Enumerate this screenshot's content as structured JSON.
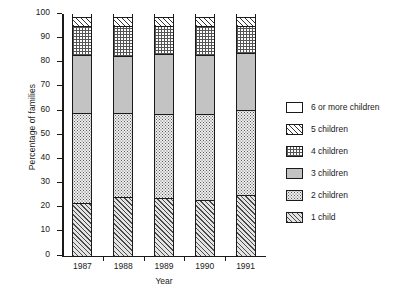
{
  "chart_data": {
    "type": "bar",
    "stacked": true,
    "title": "",
    "xlabel": "Year",
    "ylabel": "Percentage of families",
    "categories": [
      "1987",
      "1988",
      "1989",
      "1990",
      "1991"
    ],
    "ylim": [
      0,
      100
    ],
    "yticks": [
      0,
      10,
      20,
      30,
      40,
      50,
      60,
      70,
      80,
      90,
      100
    ],
    "grid": false,
    "legend_position": "right",
    "series": [
      {
        "name": "1 child",
        "pattern": "diagonal-hatch",
        "values": [
          21.5,
          24.0,
          23.5,
          22.5,
          24.5
        ]
      },
      {
        "name": "2 children",
        "pattern": "fine-stipple",
        "values": [
          37.0,
          34.5,
          34.5,
          35.5,
          35.5
        ]
      },
      {
        "name": "3 children",
        "pattern": "solid-grey",
        "values": [
          24.0,
          23.5,
          25.0,
          24.5,
          23.5
        ]
      },
      {
        "name": "4 children",
        "pattern": "cross-hatch-grid",
        "values": [
          12.0,
          12.5,
          11.5,
          12.0,
          11.0
        ]
      },
      {
        "name": "5 children",
        "pattern": "wide-hatch",
        "values": [
          4.0,
          4.0,
          4.0,
          4.0,
          4.0
        ]
      },
      {
        "name": "6 or more children",
        "pattern": "empty-white",
        "values": [
          1.5,
          1.5,
          1.5,
          1.5,
          1.5
        ]
      }
    ],
    "cumulative_tops": {
      "1987": [
        21.5,
        58.5,
        82.5,
        94.5,
        98.5,
        100
      ],
      "1988": [
        24.0,
        58.5,
        82.0,
        94.5,
        98.5,
        100
      ],
      "1989": [
        23.5,
        58.0,
        83.0,
        94.5,
        98.5,
        100
      ],
      "1990": [
        22.5,
        58.0,
        82.5,
        94.5,
        98.5,
        100
      ],
      "1991": [
        24.5,
        60.0,
        83.5,
        94.5,
        98.5,
        100
      ]
    }
  },
  "legend": {
    "entries": [
      {
        "label": "6 or more children",
        "pattern": "empty-white"
      },
      {
        "label": "5 children",
        "pattern": "wide-hatch"
      },
      {
        "label": "4 children",
        "pattern": "cross-hatch-grid"
      },
      {
        "label": "3 children",
        "pattern": "solid-grey"
      },
      {
        "label": "2 children",
        "pattern": "fine-stipple"
      },
      {
        "label": "1 child",
        "pattern": "diagonal-hatch"
      }
    ]
  }
}
